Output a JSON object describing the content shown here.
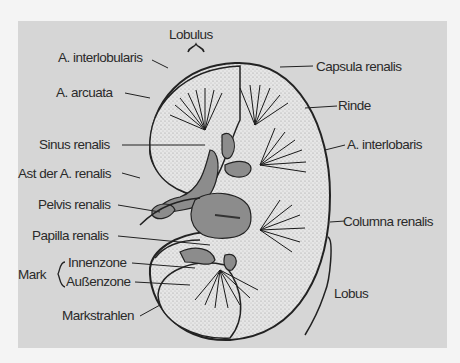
{
  "diagram": {
    "labels": {
      "lobulus": "Lobulus",
      "a_interlobularis": "A. interlobularis",
      "capsula_renalis": "Capsula renalis",
      "a_arcuata": "A. arcuata",
      "rinde": "Rinde",
      "sinus_renalis": "Sinus renalis",
      "a_interlobaris": "A. interlobaris",
      "ast_der_a_renalis": "Ast der A. renalis",
      "pelvis_renalis": "Pelvis renalis",
      "columna_renalis": "Columna renalis",
      "papilla_renalis": "Papilla renalis",
      "mark": "Mark",
      "innenzone": "Innenzone",
      "aussenzone": "Außenzone",
      "lobus": "Lobus",
      "markstrahlen": "Markstrahlen"
    },
    "colors": {
      "background": "#d6d6d6",
      "cortex": "#e4e4e4",
      "sinus": "#8c8c8c",
      "outline": "#222222",
      "text": "#2a2a2a"
    }
  }
}
